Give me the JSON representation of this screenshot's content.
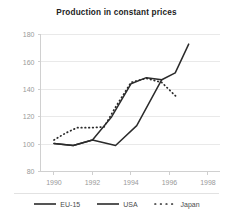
{
  "chart_data": {
    "type": "line",
    "title": "Production in constant prices",
    "xlabel": "",
    "ylabel": "",
    "xlim": [
      1989.3,
      1998.6
    ],
    "ylim": [
      80,
      180
    ],
    "xticks": [
      1990,
      1992,
      1994,
      1996,
      1998
    ],
    "yticks": [
      80,
      100,
      120,
      140,
      160,
      180
    ],
    "grid": true,
    "legend_position": "bottom",
    "series": [
      {
        "name": "EU-15",
        "style": "solid",
        "color": "#2b2b2b",
        "x": [
          1990.0,
          1991.0,
          1992.0,
          1993.0,
          1994.0,
          1994.8,
          1995.6
        ],
        "y": [
          100.5,
          99.0,
          103.0,
          120.0,
          144.0,
          148.5,
          147.0
        ]
      },
      {
        "name": "USA",
        "style": "solid",
        "color": "#2b2b2b",
        "x": [
          1990.0,
          1991.0,
          1992.0,
          1993.2,
          1994.3,
          1995.6,
          1996.3,
          1997.0
        ],
        "y": [
          100.5,
          99.0,
          103.0,
          99.0,
          113.5,
          147.0,
          152.0,
          173.0
        ]
      },
      {
        "name": "Japan",
        "style": "dotted",
        "color": "#2b2b2b",
        "x": [
          1990.0,
          1990.6,
          1991.2,
          1992.0,
          1992.6,
          1993.2,
          1994.0,
          1994.8,
          1995.6,
          1996.4
        ],
        "y": [
          103.0,
          108.0,
          112.0,
          112.0,
          112.5,
          127.0,
          145.0,
          148.0,
          145.0,
          134.0
        ]
      }
    ]
  },
  "legend": {
    "items": [
      {
        "label": "EU-15",
        "style": "solid"
      },
      {
        "label": "USA",
        "style": "solid"
      },
      {
        "label": "Japan",
        "style": "dotted"
      }
    ]
  }
}
